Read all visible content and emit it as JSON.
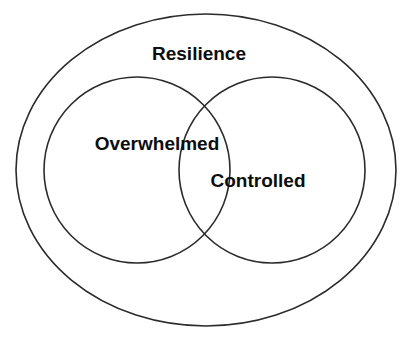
{
  "diagram": {
    "type": "venn",
    "background_color": "#ffffff",
    "stroke_color": "#2b2b2b",
    "text_color": "#0d0d0d",
    "outer_set": {
      "label": "Resilience",
      "shape": "ellipse",
      "cx": 206,
      "cy": 170,
      "rx": 190,
      "ry": 156,
      "stroke_width": 1.6,
      "label_x": 199,
      "label_y": 60,
      "font_size": 19
    },
    "inner_sets": [
      {
        "label": "Overwhelmed",
        "shape": "circle",
        "cx": 137,
        "cy": 170,
        "r": 93,
        "stroke_width": 1.6,
        "label_x": 157,
        "label_y": 150,
        "font_size": 19
      },
      {
        "label": "Controlled",
        "shape": "circle",
        "cx": 272,
        "cy": 170,
        "r": 93,
        "stroke_width": 1.6,
        "label_x": 258,
        "label_y": 187,
        "font_size": 19
      }
    ],
    "intersection": {
      "top_crossing_x": 207,
      "top_crossing_y": 98,
      "bottom_crossing_x": 207,
      "bottom_crossing_y": 243
    }
  }
}
